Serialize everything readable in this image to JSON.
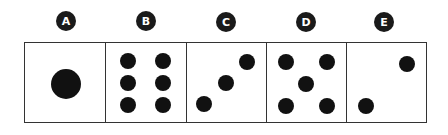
{
  "colors": {
    "dot": "#111111",
    "border": "#333333",
    "label_bg": "#1a1a1a",
    "label_fg": "#ffffff"
  },
  "options": [
    {
      "label": "A",
      "dots": 1,
      "label_x": 66,
      "label_y": 21,
      "box_x": 24,
      "box_w": 82,
      "points": [
        [
          66,
          84,
          15
        ]
      ]
    },
    {
      "label": "B",
      "dots": 6,
      "label_x": 146,
      "label_y": 21,
      "box_x": 105,
      "box_w": 82,
      "points": [
        [
          128,
          61,
          8
        ],
        [
          163,
          61,
          8
        ],
        [
          128,
          83,
          8
        ],
        [
          163,
          83,
          8
        ],
        [
          128,
          105,
          8
        ],
        [
          163,
          105,
          8
        ]
      ]
    },
    {
      "label": "C",
      "dots": 3,
      "label_x": 226,
      "label_y": 22,
      "box_x": 186,
      "box_w": 81,
      "points": [
        [
          204,
          104,
          8
        ],
        [
          226,
          83,
          8
        ],
        [
          247,
          62,
          8
        ]
      ]
    },
    {
      "label": "D",
      "dots": 5,
      "label_x": 306,
      "label_y": 22,
      "box_x": 266,
      "box_w": 81,
      "points": [
        [
          286,
          62,
          8
        ],
        [
          327,
          62,
          8
        ],
        [
          306,
          84,
          8
        ],
        [
          286,
          106,
          8
        ],
        [
          327,
          106,
          8
        ]
      ]
    },
    {
      "label": "E",
      "dots": 2,
      "label_x": 384,
      "label_y": 22,
      "box_x": 346,
      "box_w": 81,
      "points": [
        [
          407,
          64,
          8
        ],
        [
          366,
          106,
          8
        ]
      ]
    }
  ]
}
